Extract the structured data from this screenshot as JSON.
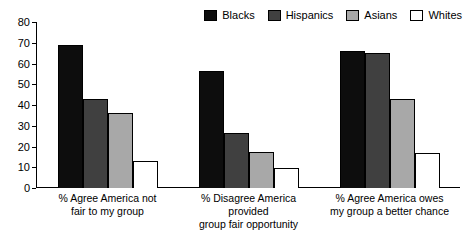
{
  "chart_data": {
    "type": "bar",
    "title": "",
    "subtitle": "",
    "xlabel": "",
    "ylabel": "",
    "ylim": [
      0,
      80
    ],
    "yticks": [
      0,
      10,
      20,
      30,
      40,
      50,
      60,
      70,
      80
    ],
    "grid": false,
    "legend_position": "top-right",
    "categories": [
      "% Agree America not fair to my group",
      "% Disagree America provided group fair opportunity",
      "% Agree America owes my group a better chance"
    ],
    "category_lines": [
      [
        "% Agree America not",
        "fair to my group"
      ],
      [
        "% Disagree America provided",
        "group fair opportunity"
      ],
      [
        "% Agree America owes",
        "my group a better chance"
      ]
    ],
    "series": [
      {
        "name": "Blacks",
        "color": "#0d0d0d",
        "values": [
          69,
          56.5,
          66
        ]
      },
      {
        "name": "Hispanics",
        "color": "#404040",
        "values": [
          43,
          26.5,
          65
        ]
      },
      {
        "name": "Asians",
        "color": "#a8a8a8",
        "values": [
          36,
          17.5,
          43
        ]
      },
      {
        "name": "Whites",
        "color": "#ffffff",
        "values": [
          13,
          9.5,
          17
        ]
      }
    ]
  }
}
